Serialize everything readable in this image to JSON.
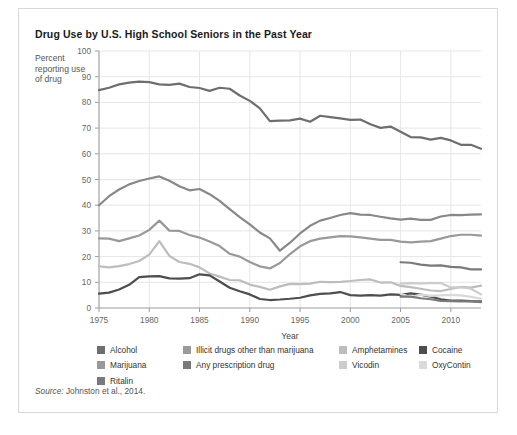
{
  "card": {
    "title": "Drug Use by U.S. High School Seniors in the Past Year",
    "ylabel_text": "Percent reporting use of drug",
    "source_prefix": "Source:",
    "source_text": " Johnston et al., 2014."
  },
  "chart_data": {
    "type": "line",
    "title": "Drug Use by U.S. High School Seniors in the Past Year",
    "xlabel": "Year",
    "ylabel": "Percent reporting use of drug",
    "xlim": [
      1975,
      2013
    ],
    "ylim": [
      0,
      100
    ],
    "xticks": [
      1975,
      1980,
      1985,
      1990,
      1995,
      2000,
      2005,
      2010
    ],
    "yticks": [
      0,
      10,
      20,
      30,
      40,
      50,
      60,
      70,
      80,
      90,
      100
    ],
    "grid": true,
    "legend_position": "bottom",
    "series": [
      {
        "name": "Alcohol",
        "color": "#6e6e6e",
        "x": [
          1975,
          1976,
          1977,
          1978,
          1979,
          1980,
          1981,
          1982,
          1983,
          1984,
          1985,
          1986,
          1987,
          1988,
          1989,
          1990,
          1991,
          1992,
          1993,
          1994,
          1995,
          1996,
          1997,
          1998,
          1999,
          2000,
          2001,
          2002,
          2003,
          2004,
          2005,
          2006,
          2007,
          2008,
          2009,
          2010,
          2011,
          2012,
          2013
        ],
        "values": [
          84.8,
          85.7,
          87.0,
          87.7,
          88.1,
          87.9,
          87.0,
          86.8,
          87.3,
          86.0,
          85.6,
          84.5,
          85.7,
          85.3,
          82.7,
          80.6,
          77.7,
          72.7,
          72.9,
          73.0,
          73.7,
          72.5,
          74.8,
          74.3,
          73.8,
          73.2,
          73.3,
          71.5,
          70.1,
          70.6,
          68.6,
          66.5,
          66.4,
          65.5,
          66.2,
          65.2,
          63.5,
          63.5,
          62.0
        ]
      },
      {
        "name": "Illicit drugs other than marijuana",
        "color": "#888888",
        "x": [
          1975,
          1976,
          1977,
          1978,
          1979,
          1980,
          1981,
          1982,
          1983,
          1984,
          1985,
          1986,
          1987,
          1988,
          1989,
          1990,
          1991,
          1992,
          1993,
          1994,
          1995,
          1996,
          1997,
          1998,
          1999,
          2000,
          2001,
          2002,
          2003,
          2004,
          2005,
          2006,
          2007,
          2008,
          2009,
          2010,
          2011,
          2012,
          2013
        ],
        "values": [
          40.0,
          43.5,
          46.1,
          48.1,
          49.4,
          50.4,
          51.2,
          49.5,
          47.4,
          45.8,
          46.3,
          44.3,
          41.7,
          38.5,
          35.4,
          32.5,
          29.4,
          27.1,
          22.3,
          25.4,
          29.0,
          32.0,
          34.0,
          35.0,
          36.2,
          36.9,
          36.3,
          36.2,
          35.5,
          34.9,
          34.4,
          34.8,
          34.3,
          34.3,
          35.6,
          36.2,
          36.1,
          36.3,
          36.4
        ]
      },
      {
        "name": "Marijuana",
        "color": "#999999",
        "x": [
          1975,
          1976,
          1977,
          1978,
          1979,
          1980,
          1981,
          1982,
          1983,
          1984,
          1985,
          1986,
          1987,
          1988,
          1989,
          1990,
          1991,
          1992,
          1993,
          1994,
          1995,
          1996,
          1997,
          1998,
          1999,
          2000,
          2001,
          2002,
          2003,
          2004,
          2005,
          2006,
          2007,
          2008,
          2009,
          2010,
          2011,
          2012,
          2013
        ],
        "values": [
          27.1,
          27.0,
          26.0,
          27.1,
          28.2,
          30.4,
          34.0,
          30.1,
          30.0,
          28.4,
          27.4,
          25.9,
          24.1,
          21.1,
          20.0,
          17.9,
          16.2,
          15.4,
          17.5,
          21.0,
          24.0,
          26.0,
          27.0,
          27.5,
          28.0,
          27.9,
          27.5,
          27.0,
          26.5,
          26.5,
          25.8,
          25.5,
          25.8,
          26.0,
          27.0,
          28.0,
          28.5,
          28.5,
          28.2
        ]
      },
      {
        "name": "Amphetamines",
        "color": "#bdbdbd",
        "x": [
          1975,
          1976,
          1977,
          1978,
          1979,
          1980,
          1981,
          1982,
          1983,
          1984,
          1985,
          1986,
          1987,
          1988,
          1989,
          1990,
          1991,
          1992,
          1993,
          1994,
          1995,
          1996,
          1997,
          1998,
          1999,
          2000,
          2001,
          2002,
          2003,
          2004,
          2005,
          2006,
          2007,
          2008,
          2009,
          2010,
          2011,
          2012,
          2013
        ],
        "values": [
          16.2,
          15.8,
          16.3,
          17.1,
          18.3,
          20.8,
          26.0,
          20.3,
          17.9,
          17.2,
          15.8,
          13.4,
          12.2,
          10.9,
          10.8,
          9.1,
          8.2,
          7.1,
          8.4,
          9.4,
          9.3,
          9.5,
          10.2,
          10.1,
          10.2,
          10.5,
          10.9,
          11.1,
          9.9,
          10.0,
          8.6,
          8.1,
          7.5,
          6.8,
          6.6,
          7.4,
          8.2,
          7.9,
          8.7
        ]
      },
      {
        "name": "Cocaine",
        "color": "#4d4d4d",
        "x": [
          1975,
          1976,
          1977,
          1978,
          1979,
          1980,
          1981,
          1982,
          1983,
          1984,
          1985,
          1986,
          1987,
          1988,
          1989,
          1990,
          1991,
          1992,
          1993,
          1994,
          1995,
          1996,
          1997,
          1998,
          1999,
          2000,
          2001,
          2002,
          2003,
          2004,
          2005,
          2006,
          2007,
          2008,
          2009,
          2010,
          2011,
          2012,
          2013
        ],
        "values": [
          5.6,
          6.0,
          7.2,
          9.0,
          12.0,
          12.3,
          12.4,
          11.5,
          11.4,
          11.6,
          13.1,
          12.7,
          10.3,
          7.9,
          6.5,
          5.3,
          3.5,
          3.1,
          3.3,
          3.6,
          4.0,
          4.9,
          5.5,
          5.7,
          6.2,
          5.0,
          4.8,
          5.0,
          4.8,
          5.3,
          5.1,
          5.7,
          5.2,
          4.4,
          3.4,
          2.9,
          2.9,
          2.7,
          2.6
        ]
      },
      {
        "name": "Any prescription drug",
        "color": "#7a7a7a",
        "x": [
          2005,
          2006,
          2007,
          2008,
          2009,
          2010,
          2011,
          2012,
          2013
        ],
        "values": [
          17.8,
          17.6,
          16.9,
          16.5,
          16.6,
          16.0,
          15.8,
          15.0,
          15.0
        ]
      },
      {
        "name": "Vicodin",
        "color": "#cccccc",
        "x": [
          2005,
          2006,
          2007,
          2008,
          2009,
          2010,
          2011,
          2012,
          2013
        ],
        "values": [
          9.5,
          9.7,
          9.6,
          9.7,
          9.7,
          8.0,
          8.1,
          7.5,
          5.3
        ]
      },
      {
        "name": "OxyContin",
        "color": "#d9d9d9",
        "x": [
          2005,
          2006,
          2007,
          2008,
          2009,
          2010,
          2011,
          2012,
          2013
        ],
        "values": [
          5.5,
          4.3,
          5.2,
          4.7,
          4.9,
          5.1,
          4.9,
          4.3,
          3.6
        ]
      },
      {
        "name": "Ritalin",
        "color": "#7a7a7a",
        "x": [
          2005,
          2006,
          2007,
          2008,
          2009,
          2010,
          2011,
          2012,
          2013
        ],
        "values": [
          4.4,
          4.4,
          3.8,
          3.4,
          2.8,
          2.7,
          2.6,
          2.6,
          2.3
        ]
      }
    ]
  },
  "legend": {
    "columns": [
      {
        "left": 0,
        "items": [
          {
            "label": "Alcohol",
            "color": "#6e6e6e"
          },
          {
            "label": "Marijuana",
            "color": "#999999"
          },
          {
            "label": "Ritalin",
            "color": "#7a7a7a"
          }
        ]
      },
      {
        "left": 86,
        "items": [
          {
            "label": "Illicit drugs other than marijuana",
            "color": "#9a9a9a"
          },
          {
            "label": "Any prescription drug",
            "color": "#7a7a7a"
          }
        ]
      },
      {
        "left": 242,
        "items": [
          {
            "label": "Amphetamines",
            "color": "#bdbdbd"
          },
          {
            "label": "Vicodin",
            "color": "#cccccc"
          }
        ]
      },
      {
        "left": 322,
        "items": [
          {
            "label": "Cocaine",
            "color": "#4d4d4d"
          },
          {
            "label": "OxyContin",
            "color": "#d9d9d9"
          }
        ]
      }
    ]
  }
}
